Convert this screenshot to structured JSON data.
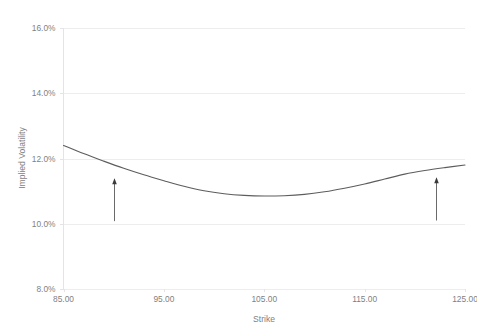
{
  "chart_data": {
    "type": "line",
    "title": "",
    "xlabel": "Strike",
    "ylabel": "Implied Volatility",
    "xlim": [
      85,
      125
    ],
    "ylim": [
      0.08,
      0.16
    ],
    "grid": true,
    "legend": "none",
    "x_ticks": [
      85,
      95,
      105,
      115,
      125
    ],
    "x_tick_labels": [
      "85.00",
      "95.00",
      "105.00",
      "115.00",
      "125.00"
    ],
    "y_ticks": [
      0.08,
      0.1,
      0.12,
      0.14,
      0.16
    ],
    "y_tick_labels": [
      "8.0%",
      "10.0%",
      "12.0%",
      "14.0%",
      "16.0%"
    ],
    "series": [
      {
        "name": "Implied Volatility Smile",
        "x": [
          85,
          87,
          89,
          91,
          93,
          95,
          97,
          99,
          101,
          103,
          105,
          107,
          109,
          111,
          113,
          115,
          117,
          119,
          121,
          123,
          125
        ],
        "values": [
          0.124,
          0.1215,
          0.1192,
          0.117,
          0.115,
          0.1132,
          0.1115,
          0.1101,
          0.1092,
          0.1087,
          0.1085,
          0.1086,
          0.109,
          0.1098,
          0.1109,
          0.1122,
          0.1137,
          0.1152,
          0.1163,
          0.1172,
          0.118
        ]
      }
    ],
    "annotations": [
      {
        "name": "left-arrow",
        "kind": "arrow-up",
        "x": 90.0,
        "y_from": 0.1008,
        "y_to": 0.1135
      },
      {
        "name": "right-arrow",
        "kind": "arrow-up",
        "x": 122.1,
        "y_from": 0.101,
        "y_to": 0.1138
      }
    ],
    "colors": {
      "background": "#ffffff",
      "gridline": "#ededed",
      "axis": "#e4e4e4",
      "series": "#5d5d5d",
      "annotation": "#3a3a3a",
      "text": "#7f7f7f"
    }
  }
}
